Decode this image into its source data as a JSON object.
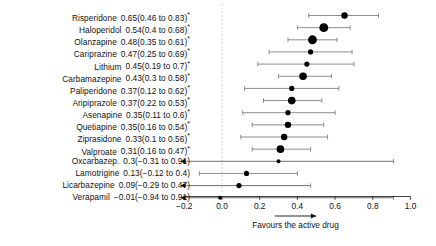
{
  "chart_data": {
    "type": "scatter",
    "subtype": "forest-plot",
    "title": "",
    "xlabel": "",
    "ylabel": "",
    "xlim": [
      -0.22,
      1.02
    ],
    "ticks": [
      -0.2,
      0.0,
      0.2,
      0.4,
      0.6,
      0.8,
      1.0
    ],
    "tick_labels": [
      "−0.2",
      "0.0",
      "0.2",
      "0.4",
      "0.6",
      "0.8",
      "1.0"
    ],
    "reference_line": 0.0,
    "reference_line_style": "dashed",
    "grid": false,
    "legend": "none",
    "annotation": "Favours the active drug",
    "annotation_arrow": {
      "from": 0.28,
      "to": 0.5,
      "direction": "right"
    },
    "significance_marker": "*",
    "marker_color": "#000000",
    "line_color": "#7a7a7a",
    "rows": [
      {
        "label": "Risperidone",
        "text": "0.65(0.46 to 0.83)",
        "est": 0.65,
        "low": 0.46,
        "high": 0.83,
        "sig": true,
        "weight": 3,
        "clip_low": false,
        "clip_high": false
      },
      {
        "label": "Haloperidol",
        "text": "0.54(0.4 to 0.68)",
        "est": 0.54,
        "low": 0.4,
        "high": 0.68,
        "sig": true,
        "weight": 5,
        "clip_low": false,
        "clip_high": false
      },
      {
        "label": "Olanzapine",
        "text": "0.48(0.35 to 0.61)",
        "est": 0.48,
        "low": 0.35,
        "high": 0.61,
        "sig": true,
        "weight": 5,
        "clip_low": false,
        "clip_high": false
      },
      {
        "label": "Cariprazine",
        "text": "0.47(0.25 to 0.69)",
        "est": 0.47,
        "low": 0.25,
        "high": 0.69,
        "sig": true,
        "weight": 2,
        "clip_low": false,
        "clip_high": false
      },
      {
        "label": "Lithium",
        "text": "0.45(0.19 to 0.7)",
        "est": 0.45,
        "low": 0.19,
        "high": 0.7,
        "sig": true,
        "weight": 2,
        "clip_low": false,
        "clip_high": false
      },
      {
        "label": "Carbamazepine",
        "text": "0.43(0.3 to 0.58)",
        "est": 0.43,
        "low": 0.3,
        "high": 0.58,
        "sig": true,
        "weight": 4,
        "clip_low": false,
        "clip_high": false
      },
      {
        "label": "Paliperidone",
        "text": "0.37(0.12 to 0.62)",
        "est": 0.37,
        "low": 0.12,
        "high": 0.62,
        "sig": true,
        "weight": 2,
        "clip_low": false,
        "clip_high": false
      },
      {
        "label": "Aripiprazole",
        "text": "0.37(0.22 to 0.53)",
        "est": 0.37,
        "low": 0.22,
        "high": 0.53,
        "sig": true,
        "weight": 4,
        "clip_low": false,
        "clip_high": false
      },
      {
        "label": "Asenapine",
        "text": "0.35(0.11 to 0.6)",
        "est": 0.35,
        "low": 0.11,
        "high": 0.6,
        "sig": true,
        "weight": 2,
        "clip_low": false,
        "clip_high": false
      },
      {
        "label": "Quetiapine",
        "text": "0.35(0.16 to 0.54)",
        "est": 0.35,
        "low": 0.16,
        "high": 0.54,
        "sig": true,
        "weight": 3,
        "clip_low": false,
        "clip_high": false
      },
      {
        "label": "Ziprasidone",
        "text": "0.33(0.1 to 0.56)",
        "est": 0.33,
        "low": 0.1,
        "high": 0.56,
        "sig": true,
        "weight": 3,
        "clip_low": false,
        "clip_high": false
      },
      {
        "label": "Valproate",
        "text": "0.31(0.16 to 0.47)",
        "est": 0.31,
        "low": 0.16,
        "high": 0.47,
        "sig": true,
        "weight": 4,
        "clip_low": false,
        "clip_high": false
      },
      {
        "label": "Oxcarbazep.",
        "text": "0.3(−0.31 to 0.91)",
        "est": 0.3,
        "low": -0.31,
        "high": 0.91,
        "sig": false,
        "weight": 1,
        "clip_low": true,
        "clip_high": false
      },
      {
        "label": "Lamotrigine",
        "text": "0.13(−0.12 to 0.4)",
        "est": 0.13,
        "low": -0.12,
        "high": 0.4,
        "sig": false,
        "weight": 2,
        "clip_low": false,
        "clip_high": false
      },
      {
        "label": "Licarbazepine",
        "text": "0.09(−0.29 to 0.47)",
        "est": 0.09,
        "low": -0.29,
        "high": 0.47,
        "sig": false,
        "weight": 2,
        "clip_low": true,
        "clip_high": false
      },
      {
        "label": "Verapamil",
        "text": "−0.01(−0.94 to 0.91)",
        "est": -0.01,
        "low": -0.94,
        "high": 0.91,
        "sig": false,
        "weight": 1,
        "clip_low": true,
        "clip_high": false
      }
    ]
  }
}
